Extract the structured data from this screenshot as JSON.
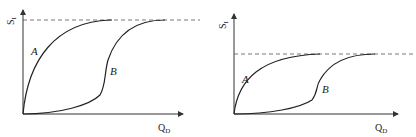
{
  "figure": {
    "panels": [
      {
        "id": "left",
        "y_label": "S",
        "y_label_sub": "I",
        "x_label": "Q",
        "x_label_sub": "D",
        "curve_a_label": "A",
        "curve_b_label": "B",
        "saturation": "high"
      },
      {
        "id": "right",
        "y_label": "S",
        "y_label_sub": "I",
        "x_label": "Q",
        "x_label_sub": "D",
        "curve_a_label": "A",
        "curve_b_label": "B",
        "saturation": "low"
      }
    ],
    "colors": {
      "line": "#222222",
      "dash": "#555555",
      "background": "#ffffff"
    }
  }
}
